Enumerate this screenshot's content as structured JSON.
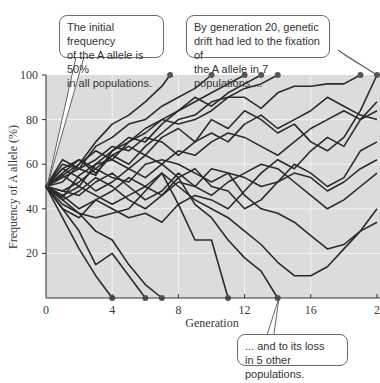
{
  "chart_data": {
    "type": "line",
    "title": "",
    "xlabel": "Generation",
    "ylabel": "Frequency of A allele (%)",
    "xlim": [
      0,
      20
    ],
    "ylim": [
      0,
      100
    ],
    "x_ticks": [
      "0",
      "4",
      "8",
      "12",
      "16",
      "20"
    ],
    "y_ticks": [
      "20",
      "40",
      "60",
      "80",
      "100"
    ],
    "grid": true,
    "background_color": "#dcdcdc",
    "line_color": "#2a2a2a",
    "initial_frequency": 50,
    "num_populations": 20,
    "fixed_count": 7,
    "lost_count": 5,
    "fixation_generations": [
      7.5,
      10,
      12,
      13,
      14,
      19,
      20
    ],
    "loss_generations": [
      4,
      6,
      7,
      11,
      14
    ],
    "series": [
      {
        "name": "pop1",
        "x": [
          0,
          1,
          2,
          3,
          4,
          5,
          6,
          7,
          7.5
        ],
        "y": [
          50,
          55,
          60,
          70,
          78,
          82,
          88,
          95,
          100
        ]
      },
      {
        "name": "pop2",
        "x": [
          0,
          1,
          2,
          3,
          4,
          5,
          6,
          7,
          8,
          9,
          10
        ],
        "y": [
          50,
          60,
          58,
          68,
          72,
          78,
          80,
          86,
          90,
          94,
          100
        ]
      },
      {
        "name": "pop3",
        "x": [
          0,
          1,
          2,
          3,
          4,
          5,
          6,
          7,
          8,
          9,
          10,
          11,
          12
        ],
        "y": [
          50,
          45,
          55,
          60,
          62,
          70,
          76,
          80,
          84,
          88,
          92,
          96,
          100
        ]
      },
      {
        "name": "pop4",
        "x": [
          0,
          1,
          2,
          3,
          4,
          5,
          6,
          7,
          8,
          9,
          10,
          11,
          12,
          13
        ],
        "y": [
          50,
          62,
          58,
          55,
          66,
          72,
          70,
          78,
          84,
          90,
          86,
          92,
          96,
          100
        ]
      },
      {
        "name": "pop5",
        "x": [
          0,
          1,
          2,
          3,
          4,
          5,
          6,
          7,
          8,
          9,
          10,
          11,
          12,
          13,
          14
        ],
        "y": [
          50,
          48,
          52,
          58,
          64,
          60,
          68,
          74,
          80,
          82,
          88,
          90,
          94,
          96,
          100
        ]
      },
      {
        "name": "pop6",
        "x": [
          0,
          1,
          2,
          3,
          4,
          5,
          6,
          7,
          8,
          9,
          10,
          11,
          12,
          13,
          14,
          15,
          16,
          17,
          18,
          19
        ],
        "y": [
          50,
          55,
          50,
          60,
          66,
          70,
          74,
          80,
          78,
          80,
          84,
          90,
          90,
          85,
          92,
          95,
          95,
          96,
          96,
          100
        ]
      },
      {
        "name": "pop7",
        "x": [
          0,
          1,
          2,
          3,
          4,
          5,
          6,
          7,
          8,
          9,
          10,
          11,
          12,
          13,
          14,
          15,
          16,
          17,
          18,
          19,
          20
        ],
        "y": [
          50,
          58,
          62,
          56,
          64,
          68,
          64,
          72,
          76,
          70,
          80,
          76,
          84,
          80,
          74,
          78,
          70,
          66,
          72,
          84,
          100
        ]
      },
      {
        "name": "pop8",
        "x": [
          0,
          1,
          2,
          3,
          4
        ],
        "y": [
          50,
          36,
          22,
          10,
          0
        ]
      },
      {
        "name": "pop9",
        "x": [
          0,
          1,
          2,
          3,
          4,
          5,
          6
        ],
        "y": [
          50,
          40,
          30,
          15,
          20,
          10,
          0
        ]
      },
      {
        "name": "pop10",
        "x": [
          0,
          1,
          2,
          3,
          4,
          5,
          6,
          7
        ],
        "y": [
          50,
          44,
          38,
          30,
          26,
          15,
          6,
          0
        ]
      },
      {
        "name": "pop11",
        "x": [
          0,
          1,
          2,
          3,
          4,
          5,
          6,
          7,
          8,
          9,
          10,
          11
        ],
        "y": [
          50,
          42,
          38,
          36,
          38,
          40,
          48,
          56,
          42,
          26,
          26,
          0
        ]
      },
      {
        "name": "pop12",
        "x": [
          0,
          1,
          2,
          3,
          4,
          5,
          6,
          7,
          8,
          9,
          10,
          11,
          12,
          13,
          14
        ],
        "y": [
          50,
          40,
          36,
          44,
          48,
          54,
          50,
          46,
          54,
          42,
          36,
          26,
          18,
          12,
          0
        ]
      },
      {
        "name": "pop13",
        "x": [
          0,
          1,
          2,
          3,
          4,
          5,
          6,
          7,
          8,
          9,
          10,
          11,
          12,
          13,
          14,
          15,
          16,
          17,
          18,
          19,
          20
        ],
        "y": [
          50,
          56,
          62,
          58,
          54,
          52,
          60,
          62,
          60,
          56,
          52,
          56,
          46,
          40,
          38,
          34,
          28,
          22,
          24,
          30,
          40
        ]
      },
      {
        "name": "pop14",
        "x": [
          0,
          1,
          2,
          3,
          4,
          5,
          6,
          7,
          8,
          9,
          10,
          11,
          12,
          13,
          14,
          15,
          16,
          17,
          18,
          19,
          20
        ],
        "y": [
          50,
          52,
          60,
          66,
          62,
          58,
          64,
          60,
          54,
          58,
          50,
          48,
          40,
          44,
          52,
          60,
          56,
          50,
          54,
          66,
          70
        ]
      },
      {
        "name": "pop15",
        "x": [
          0,
          1,
          2,
          3,
          4,
          5,
          6,
          7,
          8,
          9,
          10,
          11,
          12,
          13,
          14,
          15,
          16,
          17,
          18,
          19,
          20
        ],
        "y": [
          50,
          48,
          46,
          52,
          56,
          50,
          44,
          48,
          56,
          50,
          58,
          56,
          54,
          50,
          52,
          56,
          54,
          48,
          52,
          58,
          62
        ]
      },
      {
        "name": "pop16",
        "x": [
          0,
          1,
          2,
          3,
          4,
          5,
          6,
          7,
          8,
          9,
          10,
          11,
          12,
          13,
          14,
          15,
          16,
          17,
          18,
          19,
          20
        ],
        "y": [
          50,
          46,
          40,
          44,
          40,
          36,
          38,
          34,
          42,
          46,
          44,
          40,
          48,
          56,
          62,
          58,
          66,
          72,
          68,
          80,
          84
        ]
      },
      {
        "name": "pop17",
        "x": [
          0,
          1,
          2,
          3,
          4,
          5,
          6,
          7,
          8,
          9,
          10,
          11,
          12,
          13,
          14,
          15,
          16,
          17,
          18,
          19,
          20
        ],
        "y": [
          50,
          58,
          54,
          48,
          52,
          58,
          54,
          60,
          66,
          64,
          70,
          74,
          72,
          68,
          64,
          70,
          76,
          80,
          84,
          80,
          88
        ]
      },
      {
        "name": "pop18",
        "x": [
          0,
          1,
          2,
          3,
          4,
          5,
          6,
          7,
          8,
          9,
          10,
          11,
          12,
          13,
          14,
          15,
          16,
          17,
          18,
          19,
          20
        ],
        "y": [
          50,
          44,
          48,
          54,
          50,
          44,
          40,
          46,
          52,
          50,
          46,
          52,
          56,
          60,
          58,
          52,
          46,
          40,
          44,
          50,
          56
        ]
      },
      {
        "name": "pop19",
        "x": [
          0,
          1,
          2,
          3,
          4,
          5,
          6,
          7,
          8,
          9,
          10,
          11,
          12,
          13,
          14,
          15,
          16,
          17,
          18,
          19,
          20
        ],
        "y": [
          50,
          54,
          58,
          62,
          68,
          66,
          72,
          70,
          64,
          70,
          74,
          70,
          78,
          82,
          76,
          80,
          84,
          90,
          86,
          82,
          80
        ]
      },
      {
        "name": "pop20",
        "x": [
          0,
          1,
          2,
          3,
          4,
          5,
          6,
          7,
          8,
          9,
          10,
          11,
          12,
          13,
          14,
          15,
          16,
          17,
          18,
          19,
          20
        ],
        "y": [
          50,
          46,
          50,
          46,
          42,
          46,
          50,
          56,
          50,
          44,
          40,
          36,
          30,
          24,
          16,
          10,
          10,
          14,
          22,
          30,
          34
        ]
      }
    ],
    "annotations": [
      "The initial frequency of the A allele is 50% in all populations.",
      "By generation 20, genetic drift had led to the fixation of the A allele in 7 populations ...",
      "... and to its loss in 5 other populations."
    ]
  },
  "callouts": {
    "initial": [
      "The initial frequency",
      "of the A allele is 50%",
      "in all populations."
    ],
    "fixation": [
      "By generation 20, genetic",
      "drift had led to the fixation of",
      "the A allele in 7 populations ..."
    ],
    "loss": [
      "... and to its loss",
      "in 5 other populations."
    ]
  },
  "axes": {
    "xlabel": "Generation",
    "ylabel": "Frequency of A allele (%)",
    "x_ticks": [
      "0",
      "4",
      "8",
      "12",
      "16",
      "2"
    ],
    "y_ticks": [
      "20",
      "40",
      "60",
      "80",
      "100"
    ]
  }
}
